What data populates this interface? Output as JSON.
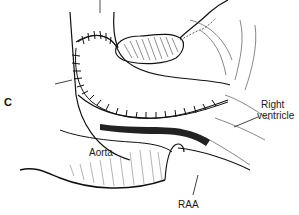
{
  "figure": {
    "panel_letter": "C",
    "style": "black-and-white surgical line illustration",
    "colors": {
      "background": "#ffffff",
      "ink": "#111111",
      "hatch": "#555555",
      "label_text": "#1a1a1a"
    }
  },
  "labels": {
    "right_ventricle_line1": "Right",
    "right_ventricle_line2": "ventricle",
    "aorta": "Aorta",
    "raa": "RAA"
  }
}
